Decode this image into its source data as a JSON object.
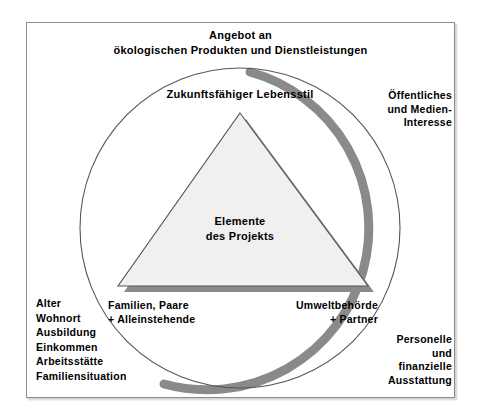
{
  "diagram": {
    "kind": "venn-pyramid-stakeholder-diagram",
    "language": "de",
    "title_top": "Angebot an\nökologischen Produkten und Dienstleistungen",
    "circle_label_top": "Zukunftsfähiger Lebensstil",
    "triangle_label": "Elemente\ndes Projekts",
    "label_right_top": "Öffentliches\nund Medien-\nInteresse",
    "label_right_bottom": "Personelle\nund\nfinanzielle\nAusstattung",
    "label_base_left": "Familien, Paare\n+ Alleinstehende",
    "label_base_right": "Umweltbehörde\n+ Partner",
    "label_left_list": "Alter\nWohnort\nAusbildung\nEinkommen\nArbeitsstätte\nFamiliensituation",
    "left_list_items": [
      "Alter",
      "Wohnort",
      "Ausbildung",
      "Einkommen",
      "Arbeitsstätte",
      "Familiensituation"
    ]
  },
  "colors": {
    "background": "#ffffff",
    "frame_border": "#8c8c8c",
    "circle_outline": "#4d4d4d",
    "circle_shadow": "#808080",
    "triangle_fill": "#f0f0f0",
    "triangle_outline": "#4d4d4d",
    "triangle_shadow": "#808080",
    "text": "#000000"
  },
  "geometry": {
    "circle_center_x": 240,
    "circle_center_y": 228,
    "circle_radius": 160,
    "triangle_apex_x": 240,
    "triangle_apex_y": 113,
    "triangle_base_y": 286,
    "triangle_base_left_x": 118,
    "triangle_base_right_x": 368
  }
}
